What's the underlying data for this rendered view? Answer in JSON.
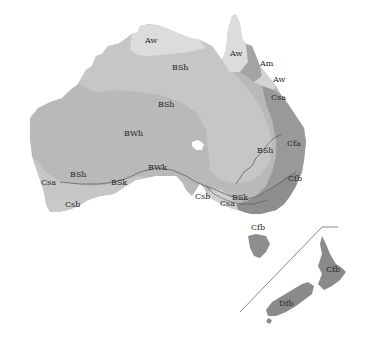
{
  "map": {
    "subject": "Köppen climate classification — Australia and New Zealand",
    "colors": {
      "background": "#ffffff",
      "BWh": "#b9b9b9",
      "BSh": "#c6c6c6",
      "BSk": "#c3c3c3",
      "Aw": "#dcdcdc",
      "Am": "#a4a4a4",
      "Cfa": "#999999",
      "Cfb": "#8e8e8e",
      "Csa": "#cfcfcf",
      "Csb": "#c9c9c9",
      "Dfb": "#8a8a8a",
      "boundary": "#555555"
    },
    "labels": [
      {
        "id": "aw-nt",
        "text": "Aw",
        "x": 145,
        "y": 43
      },
      {
        "id": "bsh-north",
        "text": "BSh",
        "x": 172,
        "y": 70
      },
      {
        "id": "aw-cape-york",
        "text": "Aw",
        "x": 230,
        "y": 56
      },
      {
        "id": "am",
        "text": "Am",
        "x": 260,
        "y": 66
      },
      {
        "id": "aw-qld-coast",
        "text": "Aw",
        "x": 273,
        "y": 82
      },
      {
        "id": "csa-qld",
        "text": "Csa",
        "x": 271,
        "y": 100
      },
      {
        "id": "bsh-central",
        "text": "BSh",
        "x": 158,
        "y": 107
      },
      {
        "id": "bwh",
        "text": "BWh",
        "x": 124,
        "y": 136
      },
      {
        "id": "cfa",
        "text": "Cfa",
        "x": 287,
        "y": 146
      },
      {
        "id": "bsh-east",
        "text": "BSh",
        "x": 257,
        "y": 153
      },
      {
        "id": "bwk",
        "text": "BWk",
        "x": 148,
        "y": 170
      },
      {
        "id": "bsh-west",
        "text": "BSh",
        "x": 70,
        "y": 177
      },
      {
        "id": "csa-west",
        "text": "Csa",
        "x": 41,
        "y": 185
      },
      {
        "id": "bsk-south",
        "text": "BSk",
        "x": 111,
        "y": 185
      },
      {
        "id": "cfb-vic",
        "text": "Cfb",
        "x": 288,
        "y": 181
      },
      {
        "id": "csb-sa",
        "text": "Csb",
        "x": 195,
        "y": 199
      },
      {
        "id": "bsk-vic",
        "text": "BSk",
        "x": 232,
        "y": 200
      },
      {
        "id": "csa-vic",
        "text": "Csa",
        "x": 220,
        "y": 206
      },
      {
        "id": "csb-west",
        "text": "Csb",
        "x": 65,
        "y": 207
      },
      {
        "id": "cfb-tas",
        "text": "Cfb",
        "x": 251,
        "y": 230
      },
      {
        "id": "cfb-nz",
        "text": "Cfb",
        "x": 326,
        "y": 272
      },
      {
        "id": "dfb-nz",
        "text": "Dfb",
        "x": 279,
        "y": 306
      }
    ]
  }
}
